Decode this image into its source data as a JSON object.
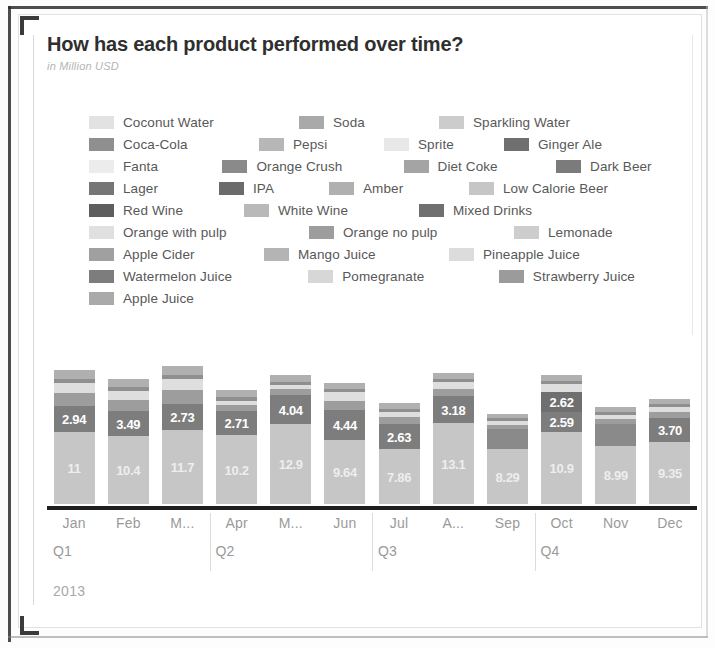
{
  "header": {
    "title": "How has each product performed over time?",
    "subtitle": "in Million USD"
  },
  "legend": {
    "rows": [
      [
        {
          "label": "Coconut Water",
          "color": "#e2e2e2",
          "width": 210
        },
        {
          "label": "Soda",
          "color": "#a9a9a9",
          "width": 140
        },
        {
          "label": "Sparkling Water",
          "color": "#cccccc",
          "width": 200
        }
      ],
      [
        {
          "label": "Coca-Cola",
          "color": "#8f8f8f",
          "width": 170
        },
        {
          "label": "Pepsi",
          "color": "#b7b7b7",
          "width": 125
        },
        {
          "label": "Sprite",
          "color": "#e8e8e8",
          "width": 120
        },
        {
          "label": "Ginger Ale",
          "color": "#6f6f6f",
          "width": 150
        }
      ],
      [
        {
          "label": "Fanta",
          "color": "#ececec",
          "width": 140
        },
        {
          "label": "Orange Crush",
          "color": "#8a8a8a",
          "width": 190
        },
        {
          "label": "Diet Coke",
          "color": "#a4a4a4",
          "width": 160
        },
        {
          "label": "Dark Beer",
          "color": "#7b7b7b",
          "width": 150
        }
      ],
      [
        {
          "label": "Lager",
          "color": "#767676",
          "width": 130
        },
        {
          "label": "IPA",
          "color": "#6b6b6b",
          "width": 110
        },
        {
          "label": "Amber",
          "color": "#b0b0b0",
          "width": 140
        },
        {
          "label": "Low Calorie Beer",
          "color": "#c6c6c6",
          "width": 210
        }
      ],
      [
        {
          "label": "Red Wine",
          "color": "#5e5e5e",
          "width": 155
        },
        {
          "label": "White Wine",
          "color": "#b9b9b9",
          "width": 175
        },
        {
          "label": "Mixed Drinks",
          "color": "#707070",
          "width": 180
        }
      ],
      [
        {
          "label": "Orange with pulp",
          "color": "#e0e0e0",
          "width": 220
        },
        {
          "label": "Orange no pulp",
          "color": "#9d9d9d",
          "width": 205
        },
        {
          "label": "Lemonade",
          "color": "#cdcdcd",
          "width": 170
        }
      ],
      [
        {
          "label": "Apple Cider",
          "color": "#a0a0a0",
          "width": 175
        },
        {
          "label": "Mango Juice",
          "color": "#b4b4b4",
          "width": 185
        },
        {
          "label": "Pineapple Juice",
          "color": "#dcdcdc",
          "width": 200
        }
      ],
      [
        {
          "label": "Watermelon Juice",
          "color": "#7d7d7d",
          "width": 230
        },
        {
          "label": "Pomegranate",
          "color": "#d7d7d7",
          "width": 200
        },
        {
          "label": "Strawberry Juice",
          "color": "#9b9b9b",
          "width": 210
        }
      ],
      [
        {
          "label": "Apple Juice",
          "color": "#aaaaaa",
          "width": 180
        }
      ]
    ]
  },
  "chart_data": {
    "type": "bar",
    "stacked": true,
    "title": "How has each product performed over time?",
    "subtitle": "in Million USD",
    "xlabel": "",
    "ylabel": "Million USD",
    "grid": false,
    "legend_position": "top",
    "categories": [
      "Jan",
      "Feb",
      "M...",
      "Apr",
      "M...",
      "Jun",
      "Jul",
      "A...",
      "Sep",
      "Oct",
      "Nov",
      "Dec"
    ],
    "quarters": [
      "Q1",
      "Q2",
      "Q3",
      "Q4"
    ],
    "year": "2013",
    "bars": [
      {
        "month": "Jan",
        "total": 20.1,
        "segments": [
          {
            "value": 11,
            "label": "11",
            "color": "#c6c6c6",
            "height": 72,
            "show_label": true
          },
          {
            "value": 2.94,
            "label": "2.94",
            "color": "#7d7d7d",
            "height": 26,
            "show_label": true
          },
          {
            "value": 2.1,
            "label": "",
            "color": "#9d9d9d",
            "height": 13,
            "show_label": false
          },
          {
            "value": 1.6,
            "label": "",
            "color": "#dedede",
            "height": 10,
            "show_label": false
          },
          {
            "value": 0.9,
            "label": "",
            "color": "#8f8f8f",
            "height": 4,
            "show_label": false
          },
          {
            "value": 1.6,
            "label": "",
            "color": "#b0b0b0",
            "height": 9,
            "show_label": false
          }
        ]
      },
      {
        "month": "Feb",
        "total": 18.6,
        "segments": [
          {
            "value": 10.4,
            "label": "10.4",
            "color": "#c6c6c6",
            "height": 68,
            "show_label": true
          },
          {
            "value": 3.49,
            "label": "3.49",
            "color": "#7d7d7d",
            "height": 25,
            "show_label": true
          },
          {
            "value": 1.9,
            "label": "",
            "color": "#9d9d9d",
            "height": 11,
            "show_label": false
          },
          {
            "value": 1.5,
            "label": "",
            "color": "#dedede",
            "height": 9,
            "show_label": false
          },
          {
            "value": 0.8,
            "label": "",
            "color": "#8f8f8f",
            "height": 4,
            "show_label": false
          },
          {
            "value": 1.4,
            "label": "",
            "color": "#b0b0b0",
            "height": 8,
            "show_label": false
          }
        ]
      },
      {
        "month": "M...",
        "total": 21.3,
        "segments": [
          {
            "value": 11.7,
            "label": "11.7",
            "color": "#c6c6c6",
            "height": 74,
            "show_label": true
          },
          {
            "value": 2.73,
            "label": "2.73",
            "color": "#7d7d7d",
            "height": 26,
            "show_label": true
          },
          {
            "value": 2.4,
            "label": "",
            "color": "#9d9d9d",
            "height": 14,
            "show_label": false
          },
          {
            "value": 1.8,
            "label": "",
            "color": "#dedede",
            "height": 11,
            "show_label": false
          },
          {
            "value": 0.9,
            "label": "",
            "color": "#8f8f8f",
            "height": 4,
            "show_label": false
          },
          {
            "value": 1.5,
            "label": "",
            "color": "#b0b0b0",
            "height": 9,
            "show_label": false
          }
        ]
      },
      {
        "month": "Apr",
        "total": 16.4,
        "segments": [
          {
            "value": 10.2,
            "label": "10.2",
            "color": "#c6c6c6",
            "height": 69,
            "show_label": true
          },
          {
            "value": 2.71,
            "label": "2.71",
            "color": "#7d7d7d",
            "height": 24,
            "show_label": true
          },
          {
            "value": 1.2,
            "label": "",
            "color": "#9d9d9d",
            "height": 6,
            "show_label": false
          },
          {
            "value": 0.7,
            "label": "",
            "color": "#dedede",
            "height": 4,
            "show_label": false
          },
          {
            "value": 0.8,
            "label": "",
            "color": "#8f8f8f",
            "height": 4,
            "show_label": false
          },
          {
            "value": 1.2,
            "label": "",
            "color": "#b0b0b0",
            "height": 7,
            "show_label": false
          }
        ]
      },
      {
        "month": "M...",
        "total": 20.7,
        "segments": [
          {
            "value": 12.9,
            "label": "12.9",
            "color": "#c6c6c6",
            "height": 80,
            "show_label": true
          },
          {
            "value": 4.04,
            "label": "4.04",
            "color": "#7d7d7d",
            "height": 29,
            "show_label": true
          },
          {
            "value": 1.0,
            "label": "",
            "color": "#9d9d9d",
            "height": 6,
            "show_label": false
          },
          {
            "value": 0.6,
            "label": "",
            "color": "#dedede",
            "height": 4,
            "show_label": false
          },
          {
            "value": 0.7,
            "label": "",
            "color": "#8f8f8f",
            "height": 3,
            "show_label": false
          },
          {
            "value": 1.1,
            "label": "",
            "color": "#b0b0b0",
            "height": 7,
            "show_label": false
          }
        ]
      },
      {
        "month": "Jun",
        "total": 17.2,
        "segments": [
          {
            "value": 9.64,
            "label": "9.64",
            "color": "#c6c6c6",
            "height": 64,
            "show_label": true
          },
          {
            "value": 4.44,
            "label": "4.44",
            "color": "#7d7d7d",
            "height": 30,
            "show_label": true
          },
          {
            "value": 1.6,
            "label": "",
            "color": "#9d9d9d",
            "height": 9,
            "show_label": false
          },
          {
            "value": 1.4,
            "label": "",
            "color": "#dedede",
            "height": 9,
            "show_label": false
          },
          {
            "value": 0.6,
            "label": "",
            "color": "#8f8f8f",
            "height": 3,
            "show_label": false
          },
          {
            "value": 1.0,
            "label": "",
            "color": "#b0b0b0",
            "height": 6,
            "show_label": false
          }
        ]
      },
      {
        "month": "Jul",
        "total": 13.6,
        "segments": [
          {
            "value": 7.86,
            "label": "7.86",
            "color": "#c6c6c6",
            "height": 55,
            "show_label": true
          },
          {
            "value": 2.63,
            "label": "2.63",
            "color": "#7d7d7d",
            "height": 25,
            "show_label": true
          },
          {
            "value": 1.2,
            "label": "",
            "color": "#9d9d9d",
            "height": 7,
            "show_label": false
          },
          {
            "value": 0.8,
            "label": "",
            "color": "#dedede",
            "height": 5,
            "show_label": false
          },
          {
            "value": 0.6,
            "label": "",
            "color": "#8f8f8f",
            "height": 3,
            "show_label": false
          },
          {
            "value": 1.0,
            "label": "",
            "color": "#b0b0b0",
            "height": 6,
            "show_label": false
          }
        ]
      },
      {
        "month": "A...",
        "total": 21.9,
        "segments": [
          {
            "value": 13.1,
            "label": "13.1",
            "color": "#c6c6c6",
            "height": 81,
            "show_label": true
          },
          {
            "value": 3.18,
            "label": "3.18",
            "color": "#7d7d7d",
            "height": 27,
            "show_label": true
          },
          {
            "value": 1.3,
            "label": "",
            "color": "#9d9d9d",
            "height": 7,
            "show_label": false
          },
          {
            "value": 1.1,
            "label": "",
            "color": "#dedede",
            "height": 7,
            "show_label": false
          },
          {
            "value": 0.7,
            "label": "",
            "color": "#8f8f8f",
            "height": 3,
            "show_label": false
          },
          {
            "value": 1.1,
            "label": "",
            "color": "#b0b0b0",
            "height": 6,
            "show_label": false
          }
        ]
      },
      {
        "month": "Sep",
        "total": 12.1,
        "segments": [
          {
            "value": 8.29,
            "label": "8.29",
            "color": "#c6c6c6",
            "height": 55,
            "show_label": true
          },
          {
            "value": 2.0,
            "label": "",
            "color": "#8a8a8a",
            "height": 20,
            "show_label": false
          },
          {
            "value": 0.7,
            "label": "",
            "color": "#9d9d9d",
            "height": 4,
            "show_label": false
          },
          {
            "value": 0.5,
            "label": "",
            "color": "#dedede",
            "height": 4,
            "show_label": false
          },
          {
            "value": 0.4,
            "label": "",
            "color": "#8f8f8f",
            "height": 3,
            "show_label": false
          },
          {
            "value": 0.7,
            "label": "",
            "color": "#b0b0b0",
            "height": 4,
            "show_label": false
          }
        ]
      },
      {
        "month": "Oct",
        "total": 20.4,
        "segments": [
          {
            "value": 10.9,
            "label": "10.9",
            "color": "#c6c6c6",
            "height": 72,
            "show_label": true
          },
          {
            "value": 2.59,
            "label": "2.59",
            "color": "#7d7d7d",
            "height": 20,
            "show_label": true
          },
          {
            "value": 2.62,
            "label": "2.62",
            "color": "#6f6f6f",
            "height": 20,
            "show_label": true
          },
          {
            "value": 1.3,
            "label": "",
            "color": "#dedede",
            "height": 8,
            "show_label": false
          },
          {
            "value": 0.7,
            "label": "",
            "color": "#8f8f8f",
            "height": 3,
            "show_label": false
          },
          {
            "value": 1.1,
            "label": "",
            "color": "#b0b0b0",
            "height": 6,
            "show_label": false
          }
        ]
      },
      {
        "month": "Nov",
        "total": 14.3,
        "segments": [
          {
            "value": 8.99,
            "label": "8.99",
            "color": "#c6c6c6",
            "height": 58,
            "show_label": true
          },
          {
            "value": 2.2,
            "label": "",
            "color": "#8a8a8a",
            "height": 22,
            "show_label": false
          },
          {
            "value": 0.9,
            "label": "",
            "color": "#9d9d9d",
            "height": 5,
            "show_label": false
          },
          {
            "value": 0.7,
            "label": "",
            "color": "#dedede",
            "height": 4,
            "show_label": false
          },
          {
            "value": 0.5,
            "label": "",
            "color": "#8f8f8f",
            "height": 3,
            "show_label": false
          },
          {
            "value": 0.8,
            "label": "",
            "color": "#b0b0b0",
            "height": 5,
            "show_label": false
          }
        ]
      },
      {
        "month": "Dec",
        "total": 16.1,
        "segments": [
          {
            "value": 9.35,
            "label": "9.35",
            "color": "#c6c6c6",
            "height": 62,
            "show_label": true
          },
          {
            "value": 3.7,
            "label": "3.70",
            "color": "#7d7d7d",
            "height": 24,
            "show_label": true
          },
          {
            "value": 1.0,
            "label": "",
            "color": "#9d9d9d",
            "height": 6,
            "show_label": false
          },
          {
            "value": 0.8,
            "label": "",
            "color": "#dedede",
            "height": 5,
            "show_label": false
          },
          {
            "value": 0.5,
            "label": "",
            "color": "#8f8f8f",
            "height": 3,
            "show_label": false
          },
          {
            "value": 0.9,
            "label": "",
            "color": "#b0b0b0",
            "height": 5,
            "show_label": false
          }
        ]
      }
    ]
  },
  "axis": {
    "months": [
      "Jan",
      "Feb",
      "M...",
      "Apr",
      "M...",
      "Jun",
      "Jul",
      "A...",
      "Sep",
      "Oct",
      "Nov",
      "Dec"
    ],
    "quarters": [
      "Q1",
      "Q2",
      "Q3",
      "Q4"
    ],
    "year": "2013"
  }
}
